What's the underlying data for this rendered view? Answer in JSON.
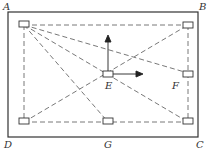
{
  "labels": {
    "A": "A",
    "B": "B",
    "C": "C",
    "D": "D",
    "E": "E",
    "F": "F",
    "G": "G"
  },
  "nodes": [
    {
      "id": "A",
      "x": 24,
      "y": 25
    },
    {
      "id": "B",
      "x": 188,
      "y": 25
    },
    {
      "id": "F",
      "x": 188,
      "y": 73
    },
    {
      "id": "E",
      "x": 108,
      "y": 74
    },
    {
      "id": "D",
      "x": 24,
      "y": 122
    },
    {
      "id": "G",
      "x": 108,
      "y": 122
    },
    {
      "id": "C",
      "x": 188,
      "y": 122
    }
  ],
  "edges": [
    [
      "A",
      "B"
    ],
    [
      "A",
      "D"
    ],
    [
      "A",
      "F"
    ],
    [
      "A",
      "C"
    ],
    [
      "A",
      "G"
    ],
    [
      "D",
      "B"
    ],
    [
      "B",
      "C"
    ],
    [
      "D",
      "C"
    ]
  ],
  "colors": {
    "line": "#333333",
    "dashed": "#555555"
  }
}
